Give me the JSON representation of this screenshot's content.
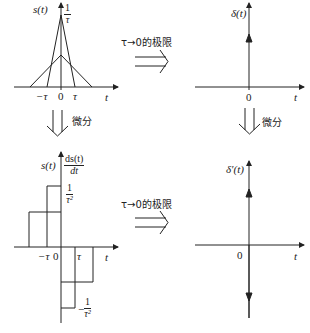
{
  "panels": {
    "top_left": {
      "ylabel": "s(t)",
      "peak_label_num": "1",
      "peak_label_den": "τ",
      "ticks": [
        "−τ",
        "0",
        "τ"
      ],
      "xlabel": "t"
    },
    "top_right": {
      "ylabel": "δ(t)",
      "tick": "0",
      "xlabel": "t"
    },
    "bottom_left": {
      "ylabel": "s(t)",
      "deriv_num": "ds(t)",
      "deriv_den": "dt",
      "pos_label_num": "1",
      "pos_label_den": "τ²",
      "neg_label_sign": "−",
      "neg_label_num": "1",
      "neg_label_den": "τ²",
      "ticks": [
        "−τ",
        "0",
        "τ"
      ],
      "xlabel": "t"
    },
    "bottom_right": {
      "ylabel": "δ′(t)",
      "tick": "0",
      "xlabel": "t"
    }
  },
  "arrows": {
    "limit_top": "τ→0的极限",
    "limit_bottom": "τ→0的极限",
    "diff_left": "微分",
    "diff_right": "微分"
  },
  "colors": {
    "ink": "#222222",
    "background": "#ffffff"
  }
}
